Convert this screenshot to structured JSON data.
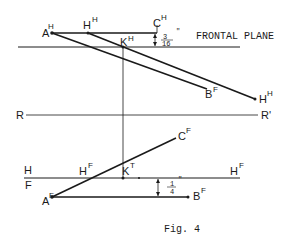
{
  "figure": {
    "caption": "Fig. 4",
    "frontal_plane_label": "FRONTAL PLANE",
    "top_view": {
      "point_A": {
        "base": "A",
        "sup": "H"
      },
      "point_H1": {
        "base": "H",
        "sup": "H"
      },
      "point_C": {
        "base": "C",
        "sup": "H"
      },
      "point_K": {
        "base": "K",
        "sup": "H"
      },
      "point_B": {
        "base": "B",
        "sup": "F"
      },
      "point_H2": {
        "base": "H",
        "sup": "H"
      },
      "dimension": {
        "num": "3",
        "den": "16",
        "unit": "\""
      }
    },
    "reference_line": {
      "left": "R",
      "right": "R'"
    },
    "front_view": {
      "fold_label_top": "H",
      "fold_label_bottom": "F",
      "point_C": {
        "base": "C",
        "sup": "F"
      },
      "point_H": {
        "base": "H",
        "sup": "F"
      },
      "point_K": {
        "base": "K",
        "sup": "T"
      },
      "point_H_right": {
        "base": "H",
        "sup": "F"
      },
      "point_A": {
        "base": "A",
        "sup": "F"
      },
      "point_B": {
        "base": "B",
        "sup": "F"
      },
      "dimension": {
        "num": "1",
        "den": "4",
        "unit": "\""
      }
    },
    "colors": {
      "ink": "#1a1a1a",
      "background": "#ffffff"
    }
  }
}
